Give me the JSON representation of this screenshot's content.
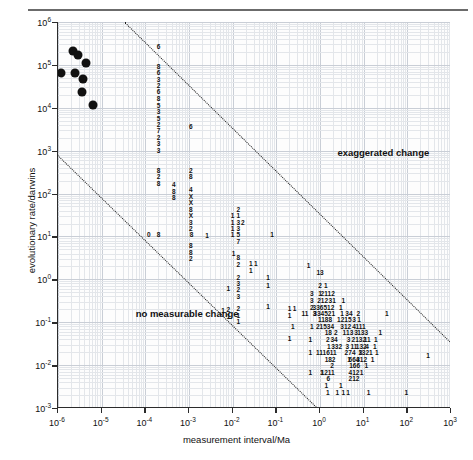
{
  "figure": {
    "xlabel": "measurement interval/Ma",
    "ylabel": "evolutionary rate/darwins",
    "annotations": [
      {
        "text": "exaggerated change",
        "x": 2.5,
        "y": 1200
      },
      {
        "text": "no measurable change",
        "x": 6e-05,
        "y": 0.22
      }
    ]
  },
  "axes": {
    "x_ticks": [
      {
        "base": "10",
        "exp": "-6"
      },
      {
        "base": "10",
        "exp": "-5"
      },
      {
        "base": "10",
        "exp": "-4"
      },
      {
        "base": "10",
        "exp": "-3"
      },
      {
        "base": "10",
        "exp": "-2"
      },
      {
        "base": "10",
        "exp": "-1"
      },
      {
        "base": "10",
        "exp": "0"
      },
      {
        "base": "10",
        "exp": "1"
      },
      {
        "base": "10",
        "exp": "2"
      },
      {
        "base": "10",
        "exp": "3"
      }
    ],
    "y_ticks": [
      {
        "base": "10",
        "exp": "6"
      },
      {
        "base": "10",
        "exp": "5"
      },
      {
        "base": "10",
        "exp": "4"
      },
      {
        "base": "10",
        "exp": "3"
      },
      {
        "base": "10",
        "exp": "2"
      },
      {
        "base": "10",
        "exp": "1"
      },
      {
        "base": "10",
        "exp": "0"
      },
      {
        "base": "10",
        "exp": "-1"
      },
      {
        "base": "10",
        "exp": "-2"
      },
      {
        "base": "10",
        "exp": "-3"
      }
    ]
  },
  "chart_data": {
    "type": "scatter",
    "title": "",
    "xlabel": "measurement interval/Ma",
    "ylabel": "evolutionary rate/darwins",
    "xscale": "log",
    "yscale": "log",
    "xlim": [
      1e-06,
      1000.0
    ],
    "ylim": [
      0.001,
      1000000.0
    ],
    "grid": true,
    "legend": "none",
    "series": [
      {
        "name": "measured rates (filled circles)",
        "marker": "filled-circle",
        "points": [
          {
            "x": 2.2e-06,
            "y": 210000.0
          },
          {
            "x": 2.9e-06,
            "y": 170000.0
          },
          {
            "x": 4.3e-06,
            "y": 110000.0
          },
          {
            "x": 1.2e-06,
            "y": 63000.0
          },
          {
            "x": 2.4e-06,
            "y": 63000.0
          },
          {
            "x": 3.7e-06,
            "y": 46000.0
          },
          {
            "x": 3.6e-06,
            "y": 23000.0
          },
          {
            "x": 6.3e-06,
            "y": 11500.0
          }
        ]
      },
      {
        "name": "binned counts (digit tallies)",
        "marker": "count-digit",
        "note": "Each glyph is a count of observations in that log-log bin; 'X' denotes a count of 10 or more.",
        "points": [
          {
            "x": 0.0002,
            "y": 260000.0,
            "label": "6"
          },
          {
            "x": 0.0002,
            "y": 90000.0,
            "label": "8"
          },
          {
            "x": 0.0002,
            "y": 63000.0,
            "label": "6"
          },
          {
            "x": 0.0002,
            "y": 45000.0,
            "label": "3"
          },
          {
            "x": 0.0002,
            "y": 32000.0,
            "label": "2"
          },
          {
            "x": 0.0002,
            "y": 23000.0,
            "label": "6"
          },
          {
            "x": 0.0002,
            "y": 16000.0,
            "label": "8"
          },
          {
            "x": 0.0002,
            "y": 11000.0,
            "label": "5"
          },
          {
            "x": 0.0002,
            "y": 8000.0,
            "label": "3"
          },
          {
            "x": 0.0002,
            "y": 5600.0,
            "label": "5"
          },
          {
            "x": 0.0002,
            "y": 4000.0,
            "label": "2"
          },
          {
            "x": 0.0002,
            "y": 2800.0,
            "label": "7"
          },
          {
            "x": 0.0002,
            "y": 2000.0,
            "label": "2"
          },
          {
            "x": 0.0002,
            "y": 1400.0,
            "label": "3"
          },
          {
            "x": 0.0002,
            "y": 1000.0,
            "label": "3"
          },
          {
            "x": 0.0002,
            "y": 340.0,
            "label": "8"
          },
          {
            "x": 0.0002,
            "y": 240.0,
            "label": "2"
          },
          {
            "x": 0.0002,
            "y": 170.0,
            "label": "8"
          },
          {
            "x": 0.0002,
            "y": 11.0,
            "label": "8"
          },
          {
            "x": 0.00045,
            "y": 160.0,
            "label": "4"
          },
          {
            "x": 0.00045,
            "y": 110.0,
            "label": "8"
          },
          {
            "x": 0.00045,
            "y": 78.0,
            "label": "8"
          },
          {
            "x": 0.0011,
            "y": 3600.0,
            "label": "6"
          },
          {
            "x": 0.0011,
            "y": 340.0,
            "label": "2"
          },
          {
            "x": 0.0011,
            "y": 240.0,
            "label": "8"
          },
          {
            "x": 0.0011,
            "y": 120.0,
            "label": "4"
          },
          {
            "x": 0.0011,
            "y": 85.0,
            "label": "X"
          },
          {
            "x": 0.0011,
            "y": 60.0,
            "label": "X"
          },
          {
            "x": 0.0011,
            "y": 42.0,
            "label": "8"
          },
          {
            "x": 0.0011,
            "y": 30.0,
            "label": "X"
          },
          {
            "x": 0.0011,
            "y": 21.0,
            "label": "3"
          },
          {
            "x": 0.0011,
            "y": 15.0,
            "label": "2"
          },
          {
            "x": 0.0011,
            "y": 6.0,
            "label": "8"
          },
          {
            "x": 0.0011,
            "y": 4.2,
            "label": "8"
          },
          {
            "x": 0.0011,
            "y": 3.0,
            "label": "2"
          },
          {
            "x": 0.0026,
            "y": 10.0,
            "label": "1"
          },
          {
            "x": 0.01,
            "y": 30.0,
            "label": "1"
          },
          {
            "x": 0.01,
            "y": 21.0,
            "label": "1"
          },
          {
            "x": 0.01,
            "y": 15.0,
            "label": "1"
          },
          {
            "x": 0.01,
            "y": 11.0,
            "label": "1"
          },
          {
            "x": 0.0135,
            "y": 42.0,
            "label": "2"
          },
          {
            "x": 0.0135,
            "y": 30.0,
            "label": "1"
          },
          {
            "x": 0.0135,
            "y": 21.0,
            "label": "3"
          },
          {
            "x": 0.0135,
            "y": 15.0,
            "label": "3"
          },
          {
            "x": 0.0135,
            "y": 11.0,
            "label": "5"
          },
          {
            "x": 0.0135,
            "y": 7.5,
            "label": "7"
          },
          {
            "x": 0.017,
            "y": 21.0,
            "label": "2"
          },
          {
            "x": 0.0135,
            "y": 3.1,
            "label": "8"
          },
          {
            "x": 0.0135,
            "y": 2.2,
            "label": "2"
          },
          {
            "x": 0.0135,
            "y": 1.1,
            "label": "2"
          },
          {
            "x": 0.0135,
            "y": 0.78,
            "label": "3"
          },
          {
            "x": 0.0135,
            "y": 0.55,
            "label": "2"
          },
          {
            "x": 0.0135,
            "y": 0.39,
            "label": "3"
          },
          {
            "x": 0.0135,
            "y": 0.2,
            "label": "2"
          },
          {
            "x": 0.0135,
            "y": 0.14,
            "label": "1"
          },
          {
            "x": 0.0135,
            "y": 0.1,
            "label": "1"
          },
          {
            "x": 0.0105,
            "y": 4.0,
            "label": "1"
          },
          {
            "x": 0.008,
            "y": 0.6,
            "label": "1"
          },
          {
            "x": 0.008,
            "y": 0.19,
            "label": "2"
          },
          {
            "x": 0.008,
            "y": 0.135,
            "label": "1"
          },
          {
            "x": 0.006,
            "y": 0.18,
            "label": "1"
          },
          {
            "x": 0.026,
            "y": 2.3,
            "label": "1"
          },
          {
            "x": 0.034,
            "y": 2.3,
            "label": "1"
          },
          {
            "x": 0.026,
            "y": 1.6,
            "label": "1"
          },
          {
            "x": 0.065,
            "y": 1.1,
            "label": "1"
          },
          {
            "x": 0.065,
            "y": 0.7,
            "label": "1"
          },
          {
            "x": 0.065,
            "y": 0.23,
            "label": "1"
          },
          {
            "x": 0.2,
            "y": 0.2,
            "label": "1"
          },
          {
            "x": 0.26,
            "y": 0.2,
            "label": "1"
          },
          {
            "x": 0.2,
            "y": 0.14,
            "label": "1"
          },
          {
            "x": 0.2,
            "y": 0.04,
            "label": "1"
          },
          {
            "x": 0.55,
            "y": 2.0,
            "label": "1"
          },
          {
            "x": 1.0,
            "y": 1.4,
            "label": "13"
          },
          {
            "x": 1.0,
            "y": 0.7,
            "label": "2"
          },
          {
            "x": 1.35,
            "y": 0.7,
            "label": "1"
          },
          {
            "x": 0.65,
            "y": 0.45,
            "label": "3"
          },
          {
            "x": 1.0,
            "y": 0.45,
            "label": "1"
          },
          {
            "x": 1.25,
            "y": 0.45,
            "label": "21"
          },
          {
            "x": 1.8,
            "y": 0.45,
            "label": "12"
          },
          {
            "x": 0.65,
            "y": 0.31,
            "label": "3"
          },
          {
            "x": 1.15,
            "y": 0.31,
            "label": "212"
          },
          {
            "x": 1.9,
            "y": 0.31,
            "label": "31"
          },
          {
            "x": 3.4,
            "y": 0.31,
            "label": "1"
          },
          {
            "x": 0.65,
            "y": 0.22,
            "label": "2"
          },
          {
            "x": 1.2,
            "y": 0.22,
            "label": "336512"
          },
          {
            "x": 3.0,
            "y": 0.22,
            "label": "1"
          },
          {
            "x": 0.45,
            "y": 0.155,
            "label": "11"
          },
          {
            "x": 0.75,
            "y": 0.155,
            "label": "3"
          },
          {
            "x": 1.25,
            "y": 0.155,
            "label": "334521"
          },
          {
            "x": 3.2,
            "y": 0.155,
            "label": "1"
          },
          {
            "x": 4.6,
            "y": 0.155,
            "label": "34"
          },
          {
            "x": 7.5,
            "y": 0.155,
            "label": "2"
          },
          {
            "x": 34.0,
            "y": 0.155,
            "label": "1"
          },
          {
            "x": 1.3,
            "y": 0.11,
            "label": "1188"
          },
          {
            "x": 3.6,
            "y": 0.11,
            "label": "1215"
          },
          {
            "x": 6.0,
            "y": 0.11,
            "label": "3"
          },
          {
            "x": 7.8,
            "y": 0.11,
            "label": "1"
          },
          {
            "x": 0.24,
            "y": 0.078,
            "label": "1"
          },
          {
            "x": 0.65,
            "y": 0.078,
            "label": "1"
          },
          {
            "x": 1.3,
            "y": 0.078,
            "label": "21534"
          },
          {
            "x": 3.9,
            "y": 0.078,
            "label": "312"
          },
          {
            "x": 6.0,
            "y": 0.078,
            "label": "4"
          },
          {
            "x": 8.5,
            "y": 0.078,
            "label": "111"
          },
          {
            "x": 1.55,
            "y": 0.055,
            "label": "18"
          },
          {
            "x": 2.3,
            "y": 0.055,
            "label": "2"
          },
          {
            "x": 3.6,
            "y": 0.055,
            "label": "1"
          },
          {
            "x": 4.8,
            "y": 0.055,
            "label": "13"
          },
          {
            "x": 6.7,
            "y": 0.055,
            "label": "3"
          },
          {
            "x": 9.5,
            "y": 0.055,
            "label": "133"
          },
          {
            "x": 24.0,
            "y": 0.055,
            "label": "1"
          },
          {
            "x": 0.6,
            "y": 0.039,
            "label": "1"
          },
          {
            "x": 1.5,
            "y": 0.039,
            "label": "2"
          },
          {
            "x": 2.1,
            "y": 0.039,
            "label": "34"
          },
          {
            "x": 4.5,
            "y": 0.039,
            "label": "3"
          },
          {
            "x": 5.8,
            "y": 0.039,
            "label": "2"
          },
          {
            "x": 8.5,
            "y": 0.039,
            "label": "132"
          },
          {
            "x": 12.0,
            "y": 0.039,
            "label": "11"
          },
          {
            "x": 19.0,
            "y": 0.039,
            "label": "1"
          },
          {
            "x": 1.6,
            "y": 0.027,
            "label": "1"
          },
          {
            "x": 2.4,
            "y": 0.027,
            "label": "332"
          },
          {
            "x": 4.2,
            "y": 0.027,
            "label": "3"
          },
          {
            "x": 6.0,
            "y": 0.027,
            "label": "11"
          },
          {
            "x": 8.8,
            "y": 0.027,
            "label": "132"
          },
          {
            "x": 12.0,
            "y": 0.027,
            "label": "4"
          },
          {
            "x": 18.0,
            "y": 0.027,
            "label": "1"
          },
          {
            "x": 0.6,
            "y": 0.019,
            "label": "1"
          },
          {
            "x": 1.4,
            "y": 0.019,
            "label": "111611"
          },
          {
            "x": 4.0,
            "y": 0.019,
            "label": "2"
          },
          {
            "x": 5.4,
            "y": 0.019,
            "label": "74"
          },
          {
            "x": 8.5,
            "y": 0.019,
            "label": "3"
          },
          {
            "x": 11.0,
            "y": 0.019,
            "label": "1321"
          },
          {
            "x": 20.0,
            "y": 0.019,
            "label": "1"
          },
          {
            "x": 1.7,
            "y": 0.0135,
            "label": "182"
          },
          {
            "x": 4.6,
            "y": 0.0135,
            "label": "1"
          },
          {
            "x": 6.0,
            "y": 0.0135,
            "label": "664"
          },
          {
            "x": 9.0,
            "y": 0.0135,
            "label": "312"
          },
          {
            "x": 16.0,
            "y": 0.0135,
            "label": "1"
          },
          {
            "x": 1.9,
            "y": 0.0095,
            "label": "2"
          },
          {
            "x": 6.2,
            "y": 0.0095,
            "label": "166"
          },
          {
            "x": 11.5,
            "y": 0.0095,
            "label": "1"
          },
          {
            "x": 0.6,
            "y": 0.0067,
            "label": "1"
          },
          {
            "x": 1.1,
            "y": 0.0067,
            "label": "1"
          },
          {
            "x": 1.5,
            "y": 0.0067,
            "label": "1211"
          },
          {
            "x": 6.0,
            "y": 0.0067,
            "label": "412"
          },
          {
            "x": 9.0,
            "y": 0.0067,
            "label": "1"
          },
          {
            "x": 1.55,
            "y": 0.0047,
            "label": "6"
          },
          {
            "x": 6.0,
            "y": 0.0047,
            "label": "212"
          },
          {
            "x": 1.4,
            "y": 0.0033,
            "label": "1"
          },
          {
            "x": 3.0,
            "y": 0.0033,
            "label": "1"
          },
          {
            "x": 1.5,
            "y": 0.0022,
            "label": "1"
          },
          {
            "x": 2.5,
            "y": 0.0022,
            "label": "1"
          },
          {
            "x": 3.4,
            "y": 0.0022,
            "label": "1"
          },
          {
            "x": 4.4,
            "y": 0.0022,
            "label": "1"
          },
          {
            "x": 13.0,
            "y": 0.0022,
            "label": "1"
          },
          {
            "x": 95.0,
            "y": 0.0022,
            "label": "1"
          },
          {
            "x": 300.0,
            "y": 0.016,
            "label": "1"
          },
          {
            "x": 0.00115,
            "y": 11.0,
            "label": "8"
          },
          {
            "x": 0.00012,
            "y": 11.0,
            "label": "0"
          },
          {
            "x": 0.08,
            "y": 11.0,
            "label": "1"
          }
        ]
      }
    ],
    "boundary_lines": [
      {
        "name": "upper-boundary",
        "style": "dotted",
        "slope": -1,
        "from": {
          "x": 3.5e-05,
          "y": 1000000.0
        },
        "to": {
          "x": 1000.0,
          "y": 0.035
        }
      },
      {
        "name": "lower-boundary",
        "style": "dotted",
        "slope": -1,
        "from": {
          "x": 1e-06,
          "y": 800.0
        },
        "to": {
          "x": 0.9,
          "y": 0.001
        }
      }
    ]
  }
}
